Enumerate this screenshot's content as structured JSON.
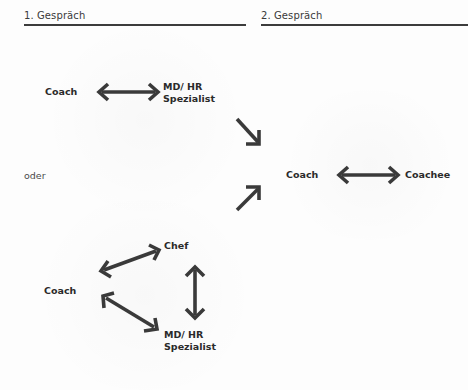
{
  "sections": {
    "first": {
      "title": "1. Gespräch"
    },
    "second": {
      "title": "2. Gespräch"
    }
  },
  "first_conversation": {
    "option_a": {
      "left_label": "Coach",
      "right_label_line1": "MD/ HR",
      "right_label_line2": "Spezialist"
    },
    "separator": "oder",
    "option_b": {
      "coach_label": "Coach",
      "chef_label": "Chef",
      "md_label_line1": "MD/ HR",
      "md_label_line2": "Spezialist"
    }
  },
  "second_conversation": {
    "left_label": "Coach",
    "right_label": "Coachee"
  },
  "arrows": [
    {
      "name": "coach-md-double-arrow",
      "type": "double",
      "direction": "horizontal"
    },
    {
      "name": "to-second-from-top",
      "type": "single",
      "direction": "down-right"
    },
    {
      "name": "to-second-from-bottom",
      "type": "single",
      "direction": "up-right"
    },
    {
      "name": "coach-coachee-double-arrow",
      "type": "double",
      "direction": "horizontal"
    },
    {
      "name": "coach-chef-double-arrow",
      "type": "double",
      "direction": "diagonal-up"
    },
    {
      "name": "coach-md-diagonal-double-arrow",
      "type": "double",
      "direction": "diagonal-down"
    },
    {
      "name": "chef-md-vertical-double-arrow",
      "type": "double",
      "direction": "vertical"
    }
  ],
  "colors": {
    "background": "#fdfdfd",
    "text": "#2a2a2a",
    "arrow": "#3a3a3a",
    "rule": "#3c3c3c"
  }
}
